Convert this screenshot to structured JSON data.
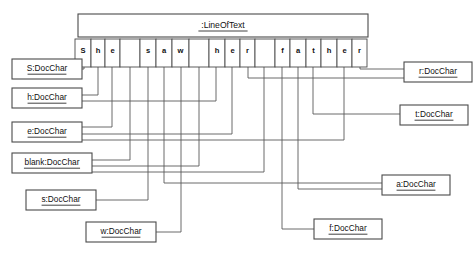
{
  "diagram": {
    "kind": "uml-object-diagram",
    "title_object": {
      "name": ":LineOfText",
      "x": 78,
      "y": 14,
      "w": 290,
      "h": 23
    },
    "text_content": "She saw her father",
    "cells": [
      {
        "char": "S",
        "x": 75,
        "w": 16
      },
      {
        "char": "h",
        "x": 91,
        "w": 14
      },
      {
        "char": "e",
        "x": 105,
        "w": 15
      },
      {
        "char": " ",
        "x": 120,
        "w": 20
      },
      {
        "char": "s",
        "x": 140,
        "w": 16
      },
      {
        "char": "a",
        "x": 156,
        "w": 16
      },
      {
        "char": "w",
        "x": 172,
        "w": 17
      },
      {
        "char": " ",
        "x": 189,
        "w": 20
      },
      {
        "char": "h",
        "x": 209,
        "w": 16
      },
      {
        "char": "e",
        "x": 225,
        "w": 15
      },
      {
        "char": "r",
        "x": 240,
        "w": 15
      },
      {
        "char": " ",
        "x": 255,
        "w": 20
      },
      {
        "char": "f",
        "x": 275,
        "w": 15
      },
      {
        "char": "a",
        "x": 290,
        "w": 16
      },
      {
        "char": "t",
        "x": 306,
        "w": 15
      },
      {
        "char": "h",
        "x": 321,
        "w": 16
      },
      {
        "char": "e",
        "x": 337,
        "w": 15
      },
      {
        "char": "r",
        "x": 352,
        "w": 15
      }
    ],
    "cell_row": {
      "y": 39,
      "h": 28
    },
    "objects": [
      {
        "id": "obj-S",
        "name": "S:DocChar",
        "x": 12,
        "y": 59,
        "w": 70,
        "h": 20
      },
      {
        "id": "obj-h",
        "name": "h:DocChar",
        "x": 12,
        "y": 88,
        "w": 70,
        "h": 20
      },
      {
        "id": "obj-e",
        "name": "e:DocChar",
        "x": 12,
        "y": 122,
        "w": 70,
        "h": 20
      },
      {
        "id": "obj-blank",
        "name": "blank:DocChar",
        "x": 12,
        "y": 153,
        "w": 80,
        "h": 20
      },
      {
        "id": "obj-s",
        "name": "s:DocChar",
        "x": 26,
        "y": 190,
        "w": 70,
        "h": 20
      },
      {
        "id": "obj-w",
        "name": "w:DocChar",
        "x": 86,
        "y": 222,
        "w": 70,
        "h": 20
      },
      {
        "id": "obj-r",
        "name": "r:DocChar",
        "x": 404,
        "y": 62,
        "w": 68,
        "h": 20
      },
      {
        "id": "obj-t",
        "name": "t:DocChar",
        "x": 400,
        "y": 105,
        "w": 68,
        "h": 20
      },
      {
        "id": "obj-a",
        "name": "a:DocChar",
        "x": 382,
        "y": 175,
        "w": 68,
        "h": 20
      },
      {
        "id": "obj-f",
        "name": "f:DocChar",
        "x": 314,
        "y": 219,
        "w": 68,
        "h": 20
      }
    ],
    "links": [
      {
        "from": "obj-S",
        "to_char": "S",
        "index": 0,
        "points": "82,69 84,69 84,67"
      },
      {
        "from": "obj-h",
        "to_char": "h",
        "index": 1,
        "points": "82,95 98,95 98,67"
      },
      {
        "from": "obj-h",
        "to_char": "h",
        "index": 8,
        "points": "82,101 216,101 216,67"
      },
      {
        "from": "obj-e",
        "to_char": "e",
        "index": 2,
        "points": "82,127 112,127 112,67"
      },
      {
        "from": "obj-e",
        "to_char": "e",
        "index": 9,
        "points": "82,134 232,134 232,67"
      },
      {
        "from": "obj-e",
        "to_char": "e",
        "index": 16,
        "points": "82,140 344,140 344,67"
      },
      {
        "from": "obj-blank",
        "to_char": " ",
        "index": 3,
        "points": "92,160 130,160 130,67"
      },
      {
        "from": "obj-blank",
        "to_char": " ",
        "index": 7,
        "points": "92,166 199,166 199,67"
      },
      {
        "from": "obj-blank",
        "to_char": " ",
        "index": 11,
        "points": "92,172 264,172 264,67"
      },
      {
        "from": "obj-s",
        "to_char": "s",
        "index": 4,
        "points": "96,200 148,200 148,67"
      },
      {
        "from": "obj-w",
        "to_char": "w",
        "index": 6,
        "points": "156,232 181,232 181,67"
      },
      {
        "from": "obj-r",
        "to_char": "r",
        "index": 17,
        "points": "404,69 360,69 360,67"
      },
      {
        "from": "obj-r",
        "to_char": "r",
        "index": 10,
        "points": "404,78 248,78 248,67"
      },
      {
        "from": "obj-t",
        "to_char": "t",
        "index": 14,
        "points": "400,114 313,114 313,67"
      },
      {
        "from": "obj-a",
        "to_char": "a",
        "index": 5,
        "points": "382,183 164,183 164,67"
      },
      {
        "from": "obj-a",
        "to_char": "a",
        "index": 13,
        "points": "382,189 298,189 298,67"
      },
      {
        "from": "obj-f",
        "to_char": "f",
        "index": 12,
        "points": "314,229 282,229 282,67"
      }
    ]
  }
}
